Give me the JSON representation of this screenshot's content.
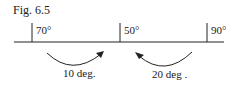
{
  "figure": {
    "title": "Fig. 6.5"
  },
  "scale": {
    "ticks": [
      {
        "label": "70°"
      },
      {
        "label": "50°"
      },
      {
        "label": "90°"
      }
    ]
  },
  "arrows": [
    {
      "label": "10 deg.",
      "direction": "right"
    },
    {
      "label": "20 deg .",
      "direction": "left"
    }
  ]
}
